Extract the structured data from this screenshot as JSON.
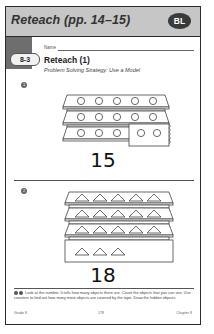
{
  "header": {
    "title": "Reteach (pp. 14–15)",
    "badge": "BL"
  },
  "worksheet": {
    "lesson": "8-3",
    "name_label": "Name",
    "title": "Reteach (1)",
    "subtitle": "Problem Solving Strategy: Use a Model"
  },
  "problems": [
    {
      "marker": "1",
      "shape": "circle",
      "number": "15",
      "visible_count": 13,
      "covered_by_tape": true
    },
    {
      "marker": "2",
      "shape": "triangle",
      "number": "18",
      "visible_count": 18,
      "covered_by_tape": false
    }
  ],
  "instructions": "Look at the number. It tells how many objects there are. Count the objects that you can see. Use counters to find out how many more objects are covered by the tape. Draw the hidden objects.",
  "footer": {
    "left": "Grade K",
    "center": "178",
    "right": "Chapter 8"
  }
}
